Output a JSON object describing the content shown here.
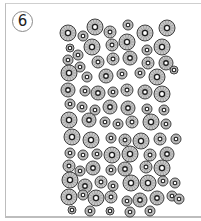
{
  "figure": {
    "panel_label": "6",
    "colors": {
      "background": "#ffffff",
      "frame": "#bdbdbd",
      "cell_fill": "#c8c8c8",
      "cell_outline": "#2a2a2a",
      "spoke": "#7a7a7a",
      "inner_ring": "#1e1e1e",
      "lumen": "#ffffff"
    },
    "cells": [
      [
        68,
        33,
        8
      ],
      [
        83,
        36,
        5
      ],
      [
        95,
        27,
        8
      ],
      [
        110,
        32,
        6
      ],
      [
        128,
        25,
        5
      ],
      [
        145,
        33,
        8
      ],
      [
        167,
        28,
        8
      ],
      [
        70,
        48,
        4
      ],
      [
        92,
        47,
        8
      ],
      [
        112,
        45,
        6
      ],
      [
        127,
        42,
        8
      ],
      [
        147,
        50,
        5
      ],
      [
        162,
        47,
        8
      ],
      [
        78,
        55,
        5
      ],
      [
        68,
        60,
        5
      ],
      [
        80,
        67,
        5
      ],
      [
        98,
        62,
        6
      ],
      [
        113,
        59,
        6
      ],
      [
        130,
        58,
        7
      ],
      [
        148,
        63,
        6
      ],
      [
        166,
        63,
        7
      ],
      [
        69,
        73,
        8
      ],
      [
        87,
        77,
        5
      ],
      [
        106,
        76,
        7
      ],
      [
        122,
        74,
        5
      ],
      [
        140,
        73,
        5
      ],
      [
        157,
        77,
        8
      ],
      [
        174,
        70,
        4
      ],
      [
        68,
        90,
        7
      ],
      [
        85,
        91,
        5
      ],
      [
        98,
        93,
        7
      ],
      [
        113,
        92,
        5
      ],
      [
        127,
        90,
        6
      ],
      [
        145,
        92,
        7
      ],
      [
        162,
        94,
        8
      ],
      [
        70,
        104,
        5
      ],
      [
        82,
        107,
        5
      ],
      [
        95,
        110,
        5
      ],
      [
        110,
        107,
        7
      ],
      [
        128,
        108,
        7
      ],
      [
        147,
        109,
        5
      ],
      [
        164,
        110,
        5
      ],
      [
        69,
        120,
        8
      ],
      [
        89,
        120,
        7
      ],
      [
        105,
        122,
        5
      ],
      [
        118,
        124,
        5
      ],
      [
        132,
        122,
        6
      ],
      [
        151,
        122,
        8
      ],
      [
        166,
        124,
        5
      ],
      [
        72,
        137,
        8
      ],
      [
        91,
        140,
        8
      ],
      [
        111,
        138,
        5
      ],
      [
        125,
        140,
        6
      ],
      [
        141,
        141,
        8
      ],
      [
        160,
        139,
        6
      ],
      [
        176,
        139,
        5
      ],
      [
        70,
        153,
        5
      ],
      [
        83,
        155,
        5
      ],
      [
        97,
        154,
        5
      ],
      [
        112,
        155,
        8
      ],
      [
        130,
        154,
        8
      ],
      [
        150,
        155,
        6
      ],
      [
        167,
        154,
        7
      ],
      [
        69,
        166,
        6
      ],
      [
        80,
        171,
        5
      ],
      [
        93,
        168,
        7
      ],
      [
        111,
        170,
        5
      ],
      [
        125,
        169,
        7
      ],
      [
        146,
        167,
        6
      ],
      [
        162,
        168,
        8
      ],
      [
        70,
        180,
        8
      ],
      [
        85,
        186,
        7
      ],
      [
        101,
        182,
        6
      ],
      [
        113,
        186,
        5
      ],
      [
        131,
        183,
        8
      ],
      [
        148,
        183,
        8
      ],
      [
        163,
        181,
        5
      ],
      [
        175,
        183,
        5
      ],
      [
        69,
        197,
        8
      ],
      [
        83,
        195,
        5
      ],
      [
        96,
        198,
        8
      ],
      [
        111,
        197,
        6
      ],
      [
        127,
        201,
        5
      ],
      [
        140,
        200,
        7
      ],
      [
        157,
        198,
        7
      ],
      [
        172,
        196,
        5
      ],
      [
        179,
        199,
        5
      ],
      [
        72,
        210,
        4
      ],
      [
        90,
        211,
        5
      ],
      [
        110,
        211,
        4
      ],
      [
        130,
        212,
        5
      ],
      [
        150,
        211,
        5
      ]
    ]
  }
}
